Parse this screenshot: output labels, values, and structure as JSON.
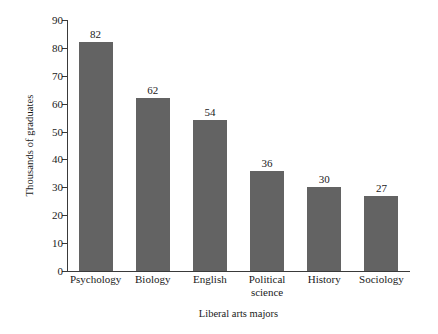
{
  "chart_data": {
    "type": "bar",
    "title": "",
    "xlabel": "Liberal arts majors",
    "ylabel": "Thousands of graduates",
    "categories": [
      "Psychology",
      "Biology",
      "English",
      "Political\nscience",
      "History",
      "Sociology"
    ],
    "values": [
      82,
      62,
      54,
      36,
      30,
      27
    ],
    "value_labels": [
      "82",
      "62",
      "54",
      "36",
      "30",
      "27"
    ],
    "ylim": [
      0,
      90
    ],
    "ytick_labels": [
      "0",
      "10",
      "20",
      "30",
      "40",
      "50",
      "60",
      "70",
      "80",
      "90"
    ],
    "ytick_values": [
      0,
      10,
      20,
      30,
      40,
      50,
      60,
      70,
      80,
      90
    ],
    "grid": false,
    "legend": null,
    "bar_color": "#636363",
    "axis_color": "#3a3a3a",
    "text_color": "#1a1a1a",
    "background_color": "#ffffff"
  }
}
